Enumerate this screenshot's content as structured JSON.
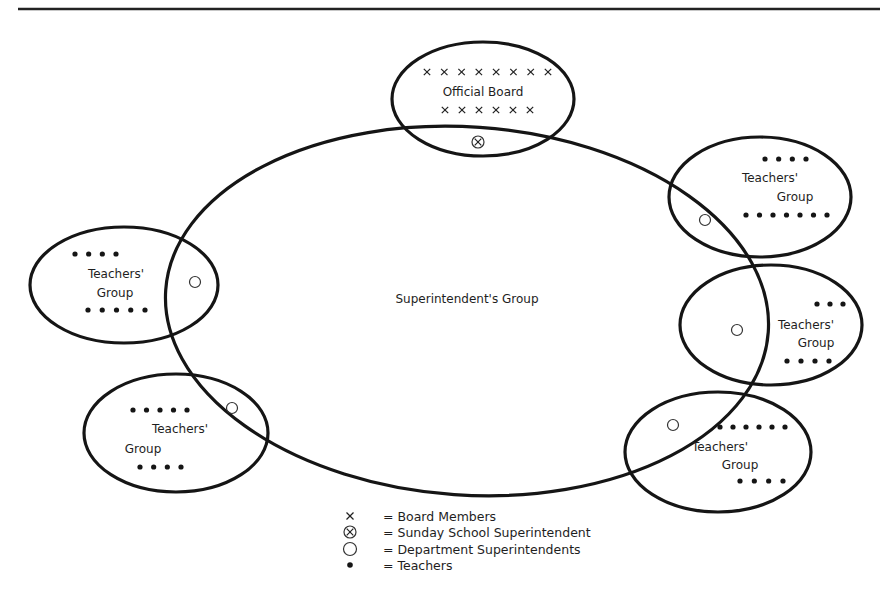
{
  "figure": {
    "rule": {
      "x1": 18,
      "x2": 880,
      "y": 9
    },
    "superintendent_group": {
      "label": "Superintendent's Group",
      "cx": 467,
      "cy": 311,
      "rx": 302,
      "ry": 184,
      "rotate": 4,
      "label_x": 467,
      "label_y": 303
    },
    "official_board": {
      "label": "Official Board",
      "cx": 483,
      "cy": 99,
      "rx": 91,
      "ry": 57,
      "label_x": 483,
      "label_y": 96,
      "top_marks": {
        "count": 8,
        "x_start": 427,
        "x_end": 548,
        "y": 72
      },
      "bottom_marks": {
        "count": 6,
        "x_start": 445,
        "x_end": 530,
        "y": 110
      },
      "sunday_superintendent": {
        "x": 478,
        "y": 142
      }
    },
    "teachers_groups": [
      {
        "id": "left-top",
        "label_line1": "Teachers'",
        "label_line2": "Group",
        "cx": 124,
        "cy": 285,
        "rx": 94,
        "ry": 58,
        "line1": {
          "x": 116,
          "y": 278
        },
        "line2": {
          "x": 115,
          "y": 297
        },
        "dept_superintendent": {
          "x": 195,
          "y": 282
        },
        "top_dots": {
          "count": 4,
          "x_start": 75,
          "x_end": 116,
          "y": 254
        },
        "bottom_dots": {
          "count": 5,
          "x_start": 88,
          "x_end": 145,
          "y": 310
        }
      },
      {
        "id": "left-bottom",
        "label_line1": "Teachers'",
        "label_line2": "Group",
        "cx": 176,
        "cy": 433,
        "rx": 92,
        "ry": 59,
        "line1": {
          "x": 180,
          "y": 433
        },
        "line2": {
          "x": 143,
          "y": 453
        },
        "dept_superintendent": {
          "x": 232,
          "y": 408
        },
        "top_dots": {
          "count": 5,
          "x_start": 133,
          "x_end": 187,
          "y": 410
        },
        "bottom_dots": {
          "count": 4,
          "x_start": 140,
          "x_end": 181,
          "y": 467
        }
      },
      {
        "id": "right-top",
        "label_line1": "Teachers'",
        "label_line2": "Group",
        "cx": 760,
        "cy": 197,
        "rx": 91,
        "ry": 60,
        "line1": {
          "x": 770,
          "y": 182
        },
        "line2": {
          "x": 795,
          "y": 201
        },
        "dept_superintendent": {
          "x": 705,
          "y": 220
        },
        "top_dots": {
          "count": 4,
          "x_start": 765,
          "x_end": 806,
          "y": 159
        },
        "bottom_dots": {
          "count": 7,
          "x_start": 746,
          "x_end": 827,
          "y": 215
        }
      },
      {
        "id": "right-middle",
        "label_line1": "Teachers'",
        "label_line2": "Group",
        "cx": 771,
        "cy": 325,
        "rx": 91,
        "ry": 60,
        "line1": {
          "x": 806,
          "y": 329
        },
        "line2": {
          "x": 816,
          "y": 347
        },
        "dept_superintendent": {
          "x": 737,
          "y": 330
        },
        "top_dots": {
          "count": 3,
          "x_start": 817,
          "x_end": 843,
          "y": 304
        },
        "bottom_dots": {
          "count": 4,
          "x_start": 787,
          "x_end": 829,
          "y": 361
        }
      },
      {
        "id": "right-bottom",
        "label_line1": "Teachers'",
        "label_line2": "Group",
        "cx": 718,
        "cy": 452,
        "rx": 93,
        "ry": 60,
        "line1": {
          "x": 720,
          "y": 451
        },
        "line2": {
          "x": 740,
          "y": 469
        },
        "dept_superintendent": {
          "x": 673,
          "y": 425
        },
        "top_dots": {
          "count": 6,
          "x_start": 720,
          "x_end": 785,
          "y": 427
        },
        "bottom_dots": {
          "count": 4,
          "x_start": 740,
          "x_end": 783,
          "y": 481
        }
      }
    ]
  },
  "legend": {
    "items": [
      {
        "symbol": "x-mark",
        "label": "= Board Members",
        "y": 516
      },
      {
        "symbol": "circled-x",
        "label": "= Sunday School Superintendent",
        "y": 532
      },
      {
        "symbol": "open-circle",
        "label": "= Department Superintendents",
        "y": 549
      },
      {
        "symbol": "filled-dot",
        "label": "= Teachers",
        "y": 565
      }
    ],
    "symbol_x": 350,
    "label_x": 383
  }
}
